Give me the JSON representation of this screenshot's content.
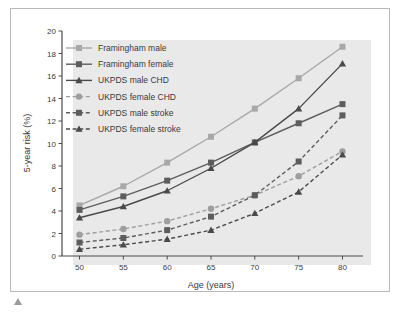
{
  "chart_data": {
    "type": "line",
    "title": "",
    "xlabel": "Age (years)",
    "ylabel": "5-year risk (%)",
    "x": [
      50,
      55,
      60,
      65,
      70,
      75,
      80
    ],
    "xlim": [
      48,
      82
    ],
    "ylim": [
      0,
      20
    ],
    "xticks": [
      "50",
      "55",
      "60",
      "65",
      "70",
      "75",
      "80"
    ],
    "yticks": [
      "0",
      "2",
      "4",
      "6",
      "8",
      "10",
      "12",
      "14",
      "16",
      "18",
      "20"
    ],
    "grid": false,
    "legend_position": "upper-left",
    "series": [
      {
        "name": "Framingham male",
        "values": [
          4.5,
          6.2,
          8.3,
          10.6,
          13.1,
          15.8,
          18.6
        ],
        "color": "#a8a8a8",
        "marker": "square",
        "dash": "solid"
      },
      {
        "name": "Framingham female",
        "values": [
          4.1,
          5.3,
          6.7,
          8.3,
          10.1,
          11.8,
          13.5
        ],
        "color": "#5d5d5d",
        "marker": "square",
        "dash": "solid"
      },
      {
        "name": "UKPDS male CHD",
        "values": [
          3.4,
          4.4,
          5.8,
          7.8,
          10.1,
          13.1,
          17.1
        ],
        "color": "#4a4a4a",
        "marker": "triangle",
        "dash": "solid"
      },
      {
        "name": "UKPDS female CHD",
        "values": [
          1.9,
          2.4,
          3.1,
          4.2,
          5.4,
          7.1,
          9.3
        ],
        "color": "#9e9e9e",
        "marker": "circle",
        "dash": "dashed"
      },
      {
        "name": "UKPDS male stroke",
        "values": [
          1.2,
          1.6,
          2.3,
          3.5,
          5.4,
          8.4,
          12.5
        ],
        "color": "#5d5d5d",
        "marker": "square",
        "dash": "dashed"
      },
      {
        "name": "UKPDS female stroke",
        "values": [
          0.6,
          1.0,
          1.5,
          2.3,
          3.8,
          5.7,
          9.0
        ],
        "color": "#4a4a4a",
        "marker": "triangle",
        "dash": "dashed"
      }
    ]
  },
  "legend": {
    "items": [
      {
        "label": "Framingham male"
      },
      {
        "label": "Framingham female"
      },
      {
        "label": "UKPDS male CHD"
      },
      {
        "label": "UKPDS female CHD"
      },
      {
        "label": "UKPDS male stroke"
      },
      {
        "label": "UKPDS female stroke"
      }
    ]
  },
  "axes": {
    "x_title": "Age (years)",
    "y_title": "5-year risk (%)"
  },
  "colors": {
    "plot_background": "#e9e9e9",
    "frame_border": "#b9b9b9",
    "axis": "#4a4a4a",
    "text": "#3a3a3a",
    "page_background": "#ffffff"
  }
}
